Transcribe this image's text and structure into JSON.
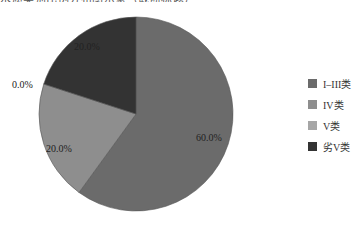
{
  "chart_data": {
    "type": "pie",
    "title": "",
    "categories": [
      "I–III类",
      "IV类",
      "V类",
      "劣V类"
    ],
    "values": [
      60.0,
      20.0,
      0.0,
      20.0
    ],
    "labels": [
      "60.0%",
      "20.0%",
      "0.0%",
      "20.0%"
    ],
    "colors": [
      "#6b6b6b",
      "#8e8e8e",
      "#a6a6a6",
      "#333333"
    ],
    "start_angle": "12 o'clock",
    "direction": "clockwise",
    "legend_position": "right"
  },
  "legend": {
    "items": [
      {
        "label": "I–III类",
        "color": "#6b6b6b"
      },
      {
        "label": "IV类",
        "color": "#8e8e8e"
      },
      {
        "label": "V类",
        "color": "#a6a6a6"
      },
      {
        "label": "劣V类",
        "color": "#333333"
      }
    ]
  },
  "slice_labels": {
    "s1": "60.0%",
    "s2": "20.0%",
    "s3": "0.0%",
    "s4": "20.0%"
  },
  "top_caption": "水质类别比例分布图示意（截断标题）"
}
